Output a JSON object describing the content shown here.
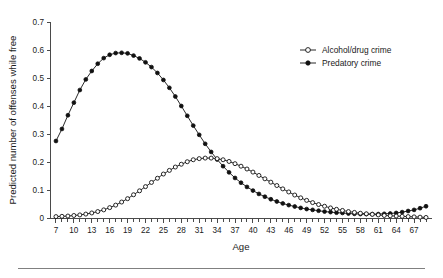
{
  "figure": {
    "background_color": "#ffffff",
    "ink_color": "#111111",
    "axis_color": "#4a4a4a",
    "rule_color": "#808080"
  },
  "legend": {
    "position": "top-right",
    "entries": [
      {
        "label": "Alcohol/drug crime",
        "marker": "open-circle"
      },
      {
        "label": "Predatory crime",
        "marker": "filled-circle"
      }
    ]
  },
  "chart_data": {
    "type": "line",
    "title": "",
    "xlabel": "Age",
    "ylabel": "Predicted number of offenses while free",
    "xlim": [
      6,
      70
    ],
    "ylim": [
      0,
      0.7
    ],
    "grid": false,
    "legend_position": "top-right",
    "x_tick_labels": [
      "7",
      "10",
      "13",
      "16",
      "19",
      "22",
      "25",
      "28",
      "31",
      "34",
      "37",
      "40",
      "43",
      "46",
      "49",
      "52",
      "55",
      "58",
      "61",
      "64",
      "67"
    ],
    "x_tick_values": [
      7,
      10,
      13,
      16,
      19,
      22,
      25,
      28,
      31,
      34,
      37,
      40,
      43,
      46,
      49,
      52,
      55,
      58,
      61,
      64,
      67
    ],
    "x_minor_tick_values": [
      7,
      8,
      9,
      10,
      11,
      12,
      13,
      14,
      15,
      16,
      17,
      18,
      19,
      20,
      21,
      22,
      23,
      24,
      25,
      26,
      27,
      28,
      29,
      30,
      31,
      32,
      33,
      34,
      35,
      36,
      37,
      38,
      39,
      40,
      41,
      42,
      43,
      44,
      45,
      46,
      47,
      48,
      49,
      50,
      51,
      52,
      53,
      54,
      55,
      56,
      57,
      58,
      59,
      60,
      61,
      62,
      63,
      64,
      65,
      66,
      67,
      68,
      69
    ],
    "y_tick_labels": [
      "0",
      "0.1",
      "0.2",
      "0.3",
      "0.4",
      "0.5",
      "0.6",
      "0.7"
    ],
    "y_tick_values": [
      0,
      0.1,
      0.2,
      0.3,
      0.4,
      0.5,
      0.6,
      0.7
    ],
    "x": [
      7,
      8,
      9,
      10,
      11,
      12,
      13,
      14,
      15,
      16,
      17,
      18,
      19,
      20,
      21,
      22,
      23,
      24,
      25,
      26,
      27,
      28,
      29,
      30,
      31,
      32,
      33,
      34,
      35,
      36,
      37,
      38,
      39,
      40,
      41,
      42,
      43,
      44,
      45,
      46,
      47,
      48,
      49,
      50,
      51,
      52,
      53,
      54,
      55,
      56,
      57,
      58,
      59,
      60,
      61,
      62,
      63,
      64,
      65,
      66,
      67,
      68,
      69
    ],
    "series": [
      {
        "name": "Predatory crime",
        "marker": "filled-circle",
        "values": [
          0.275,
          0.318,
          0.367,
          0.412,
          0.457,
          0.495,
          0.525,
          0.551,
          0.571,
          0.583,
          0.589,
          0.59,
          0.588,
          0.58,
          0.57,
          0.556,
          0.539,
          0.518,
          0.493,
          0.465,
          0.434,
          0.4,
          0.365,
          0.33,
          0.297,
          0.265,
          0.236,
          0.209,
          0.185,
          0.163,
          0.143,
          0.126,
          0.111,
          0.098,
          0.086,
          0.076,
          0.067,
          0.059,
          0.052,
          0.046,
          0.041,
          0.036,
          0.032,
          0.029,
          0.026,
          0.023,
          0.021,
          0.019,
          0.018,
          0.016,
          0.015,
          0.014,
          0.014,
          0.014,
          0.014,
          0.015,
          0.016,
          0.018,
          0.021,
          0.025,
          0.029,
          0.035,
          0.042
        ]
      },
      {
        "name": "Alcohol/drug crime",
        "marker": "open-circle",
        "values": [
          0.005,
          0.006,
          0.007,
          0.009,
          0.011,
          0.014,
          0.018,
          0.023,
          0.029,
          0.037,
          0.046,
          0.057,
          0.069,
          0.083,
          0.097,
          0.112,
          0.127,
          0.142,
          0.157,
          0.17,
          0.182,
          0.192,
          0.201,
          0.208,
          0.212,
          0.214,
          0.214,
          0.212,
          0.208,
          0.202,
          0.194,
          0.185,
          0.175,
          0.164,
          0.152,
          0.14,
          0.128,
          0.116,
          0.104,
          0.093,
          0.082,
          0.072,
          0.063,
          0.055,
          0.048,
          0.042,
          0.036,
          0.031,
          0.027,
          0.023,
          0.02,
          0.017,
          0.015,
          0.013,
          0.011,
          0.009,
          0.008,
          0.007,
          0.006,
          0.005,
          0.004,
          0.003,
          0.002
        ]
      }
    ]
  }
}
